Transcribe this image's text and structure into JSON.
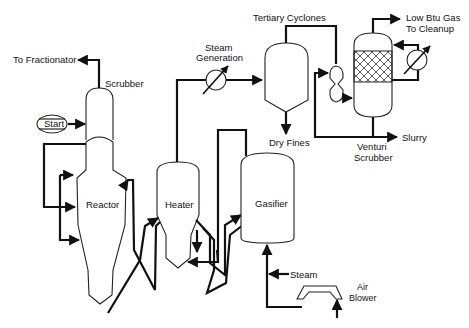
{
  "diagram": {
    "type": "process-flow",
    "labels": {
      "to_fractionator": "To Fractionator",
      "scrubber": "Scrubber",
      "start": "Start",
      "reactor": "Reactor",
      "heater": "Heater",
      "steam_generation_1": "Steam",
      "steam_generation_2": "Generation",
      "tertiary_cyclones": "Tertiary Cyclones",
      "dry_fines": "Dry Fines",
      "gasifier": "Gasifier",
      "steam": "Steam",
      "air_blower_1": "Air",
      "air_blower_2": "Blower",
      "low_btu_1": "Low Btu Gas",
      "low_btu_2": "To Cleanup",
      "slurry": "Slurry",
      "venturi_1": "Venturi",
      "venturi_2": "Scrubber"
    },
    "nodes": [
      "Scrubber",
      "Start",
      "Reactor",
      "Heater",
      "Steam Generation",
      "Tertiary Cyclones",
      "Gasifier",
      "Air Blower",
      "Venturi Scrubber"
    ],
    "edges": [
      {
        "from": "Scrubber",
        "to": "To Fractionator"
      },
      {
        "from": "Start",
        "to": "Scrubber"
      },
      {
        "from": "Scrubber",
        "to": "Reactor"
      },
      {
        "from": "Reactor",
        "to": "Heater"
      },
      {
        "from": "Heater",
        "to": "Reactor"
      },
      {
        "from": "Heater",
        "to": "Gasifier"
      },
      {
        "from": "Gasifier",
        "to": "Heater"
      },
      {
        "from": "Heater",
        "to": "Steam Generation"
      },
      {
        "from": "Steam Generation",
        "to": "Tertiary Cyclones"
      },
      {
        "from": "Tertiary Cyclones",
        "to": "Dry Fines"
      },
      {
        "from": "Tertiary Cyclones",
        "to": "Venturi Scrubber"
      },
      {
        "from": "Venturi Scrubber",
        "to": "Low Btu Gas To Cleanup"
      },
      {
        "from": "Venturi Scrubber",
        "to": "Slurry"
      },
      {
        "from": "Steam",
        "to": "Gasifier"
      },
      {
        "from": "Air Blower",
        "to": "Gasifier"
      }
    ]
  }
}
